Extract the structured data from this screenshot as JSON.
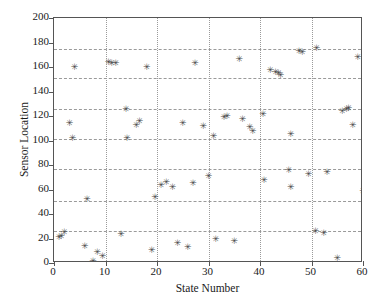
{
  "chart_data": {
    "type": "scatter",
    "title": "",
    "xlabel": "State Number",
    "ylabel": "Sensor Location",
    "xlim": [
      0,
      60
    ],
    "ylim": [
      0,
      200
    ],
    "xticks": [
      0,
      10,
      20,
      30,
      40,
      50,
      60
    ],
    "yticks": [
      0,
      20,
      40,
      60,
      80,
      100,
      120,
      140,
      160,
      180,
      200
    ],
    "grid": true,
    "grid_style": "dashed-horizontal-dotted-vertical",
    "legend": null,
    "marker": "asterisk",
    "marker_color": "#4a4a4a",
    "hlines": [
      26,
      51,
      77,
      101,
      126,
      151,
      175
    ],
    "vlines": [
      10,
      20,
      30,
      40,
      50
    ],
    "x": [
      1,
      2,
      3,
      4,
      5,
      6,
      7,
      8,
      9,
      10,
      11,
      11.4,
      12,
      13,
      14,
      15,
      16,
      16.4,
      17,
      18,
      19,
      20,
      21,
      22,
      23,
      24,
      25,
      26,
      27,
      28,
      29,
      30,
      31,
      32,
      33,
      34,
      35,
      36,
      37,
      38,
      39,
      40,
      41,
      42,
      43,
      43.6,
      44,
      45,
      46,
      47,
      48,
      49,
      50,
      51,
      52,
      53,
      54,
      55,
      56,
      57,
      58,
      59
    ],
    "y": [
      20.5,
      24.5,
      114,
      160,
      101.5,
      13.5,
      1.5,
      8.5,
      5,
      163.5,
      163.5,
      51.5,
      23.5,
      125,
      112.5,
      115.5,
      159.5,
      101.5,
      10,
      53.5,
      63,
      66,
      62,
      16,
      13,
      65,
      162.5,
      70.5,
      103.5,
      119,
      120,
      17.5,
      166,
      117,
      110.5,
      107,
      121,
      157.5,
      155.5,
      154.5,
      153,
      61.5,
      75.5,
      173,
      171.5,
      105,
      72,
      175.5,
      26,
      24,
      74,
      3.5,
      123.5,
      125.5,
      126,
      112,
      167.5,
      58,
      19.5,
      63.5,
      26,
      101.5
    ],
    "points": [
      {
        "x": 1,
        "y": 20.5
      },
      {
        "x": 1.4,
        "y": 22
      },
      {
        "x": 2,
        "y": 24.5
      },
      {
        "x": 3,
        "y": 114
      },
      {
        "x": 3.6,
        "y": 101.5
      },
      {
        "x": 4,
        "y": 160
      },
      {
        "x": 6,
        "y": 13.5
      },
      {
        "x": 6.4,
        "y": 51.5
      },
      {
        "x": 7.6,
        "y": 1.5
      },
      {
        "x": 8.4,
        "y": 8.5
      },
      {
        "x": 9.4,
        "y": 5
      },
      {
        "x": 10.6,
        "y": 163.5
      },
      {
        "x": 11.2,
        "y": 163
      },
      {
        "x": 12,
        "y": 163
      },
      {
        "x": 13,
        "y": 23.5
      },
      {
        "x": 14,
        "y": 125
      },
      {
        "x": 14.2,
        "y": 101.5
      },
      {
        "x": 16,
        "y": 112.5
      },
      {
        "x": 16.6,
        "y": 115.5
      },
      {
        "x": 18,
        "y": 159.5
      },
      {
        "x": 19,
        "y": 10
      },
      {
        "x": 19.6,
        "y": 53.5
      },
      {
        "x": 20.8,
        "y": 63
      },
      {
        "x": 21.8,
        "y": 66
      },
      {
        "x": 23,
        "y": 62
      },
      {
        "x": 24,
        "y": 16
      },
      {
        "x": 25,
        "y": 113.5
      },
      {
        "x": 26,
        "y": 13
      },
      {
        "x": 27,
        "y": 65
      },
      {
        "x": 27.4,
        "y": 162.5
      },
      {
        "x": 29,
        "y": 111.5
      },
      {
        "x": 30,
        "y": 70.5
      },
      {
        "x": 31,
        "y": 103.5
      },
      {
        "x": 31.4,
        "y": 19.5
      },
      {
        "x": 33,
        "y": 119
      },
      {
        "x": 33.6,
        "y": 120
      },
      {
        "x": 35,
        "y": 17.5
      },
      {
        "x": 36,
        "y": 166
      },
      {
        "x": 36.6,
        "y": 117
      },
      {
        "x": 38,
        "y": 110.5
      },
      {
        "x": 38.6,
        "y": 107
      },
      {
        "x": 40.6,
        "y": 121
      },
      {
        "x": 40.8,
        "y": 67.5
      },
      {
        "x": 42,
        "y": 157.5
      },
      {
        "x": 43,
        "y": 155.5
      },
      {
        "x": 43.6,
        "y": 154.5
      },
      {
        "x": 44,
        "y": 153
      },
      {
        "x": 45.6,
        "y": 75.5
      },
      {
        "x": 46,
        "y": 61.5
      },
      {
        "x": 47.6,
        "y": 173
      },
      {
        "x": 48.2,
        "y": 171.5
      },
      {
        "x": 46,
        "y": 105
      },
      {
        "x": 49.4,
        "y": 72
      },
      {
        "x": 51,
        "y": 175.5
      },
      {
        "x": 50.8,
        "y": 26
      },
      {
        "x": 52.4,
        "y": 24
      },
      {
        "x": 53,
        "y": 74
      },
      {
        "x": 55,
        "y": 3.5
      },
      {
        "x": 56,
        "y": 123.5
      },
      {
        "x": 56.8,
        "y": 125.5
      },
      {
        "x": 57.2,
        "y": 126
      },
      {
        "x": 58,
        "y": 112
      },
      {
        "x": 59,
        "y": 167.5
      },
      {
        "x": 60,
        "y": 58
      }
    ]
  }
}
